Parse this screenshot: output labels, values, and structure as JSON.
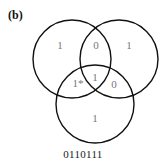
{
  "figure": {
    "panel_label": "(b)",
    "caption": "0110111",
    "colors": {
      "circle_stroke": "#111111",
      "region_text": "#777777",
      "label_text": "#111111"
    }
  },
  "circles": [
    {
      "name": "A",
      "cx": 72,
      "cy": 59,
      "r": 39
    },
    {
      "name": "B",
      "cx": 119,
      "cy": 59,
      "r": 39
    },
    {
      "name": "C",
      "cx": 95,
      "cy": 104,
      "r": 39
    }
  ],
  "regions": {
    "a_only": "1",
    "ab_only": "0",
    "b_only": "1",
    "ac_only": "1*",
    "abc": "1",
    "bc_only": "0",
    "c_only": "1"
  }
}
